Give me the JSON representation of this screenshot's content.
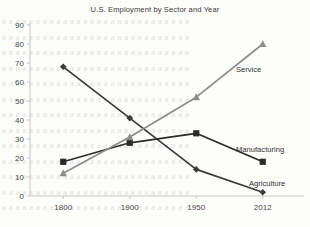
{
  "chart_data": {
    "type": "line",
    "title": "U.S. Employment by Sector and Year",
    "xlabel": "",
    "ylabel": "",
    "categories": [
      "1800",
      "1900",
      "1950",
      "2012"
    ],
    "ylim": [
      0,
      90
    ],
    "yticks": [
      "0",
      "10",
      "20",
      "30",
      "40",
      "50",
      "60",
      "70",
      "80",
      "90"
    ],
    "grid": false,
    "legend_position": "inline-annotations",
    "series": [
      {
        "name": "Agriculture",
        "values": [
          68,
          41,
          14,
          2
        ],
        "color": "#3b3b3b",
        "marker": "diamond"
      },
      {
        "name": "Manufacturing",
        "values": [
          18,
          28,
          33,
          18
        ],
        "color": "#2b2b2b",
        "marker": "square"
      },
      {
        "name": "Service",
        "values": [
          12,
          31,
          52,
          80
        ],
        "color": "#8d8d8d",
        "marker": "triangle"
      }
    ],
    "annotations": [
      {
        "text": "Service",
        "series": "Service"
      },
      {
        "text": "Manufacturing",
        "series": "Manufacturing"
      },
      {
        "text": "Agriculture",
        "series": "Agriculture"
      }
    ]
  },
  "background_text": {
    "lines": [
      "a a a a a a a a a a a a a a a a a a a a a a a a a a a a",
      "a a a a a a a a a a a a a a a a a a a a a a a a a a a a",
      "a a a a a a a a a a a a a a a a a a a a a a a a a a a a",
      "a a a a a a a a a a a a a a a a a a a a a a a a a a a a",
      "a a a a a a a a a a a a a a a a a a a a a a a a a a a a",
      "a a a a a a a a a a a a a a a a a a a a a a a a a a a a",
      "a a a a a a a a a a a a a a a a a a a a a a a a a a a a",
      "a a a a a a a a a a a a a a a a a a a a a a a a a a a a",
      "a a a a a a a a a a a a a a a a a a a a a a a a a a a a",
      "a a a a a a a a a a a a a a a a a a a a a a a a a a a a",
      "a a a a a a a a a a a a a a a a a a a a a a a a a a a a",
      "a a a a a a a a a a a a a a a a a a a a a a a a a a a a",
      "a a a a a a a a a a a a a a a a a a a a a a a a a a a a"
    ]
  }
}
